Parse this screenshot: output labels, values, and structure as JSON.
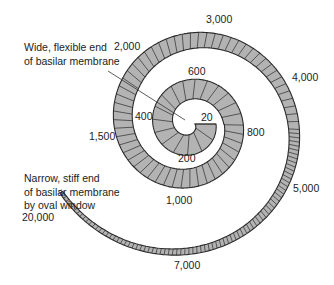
{
  "diagram": {
    "notes": {
      "apex": [
        "Wide, flexible end",
        "of basilar membrane"
      ],
      "base": [
        "Narrow, stiff end",
        "of basilar membrane",
        "by oval window"
      ]
    },
    "frequency_labels": [
      {
        "text": "20",
        "x": 201,
        "y": 111
      },
      {
        "text": "200",
        "x": 178,
        "y": 152
      },
      {
        "text": "400",
        "x": 135,
        "y": 110
      },
      {
        "text": "600",
        "x": 188,
        "y": 65
      },
      {
        "text": "800",
        "x": 247,
        "y": 126
      },
      {
        "text": "1,000",
        "x": 166,
        "y": 194
      },
      {
        "text": "1,500",
        "x": 89,
        "y": 130
      },
      {
        "text": "2,000",
        "x": 114,
        "y": 40
      },
      {
        "text": "3,000",
        "x": 206,
        "y": 13
      },
      {
        "text": "4,000",
        "x": 292,
        "y": 71
      },
      {
        "text": "5,000",
        "x": 293,
        "y": 182
      },
      {
        "text": "7,000",
        "x": 174,
        "y": 259
      },
      {
        "text": "20,000",
        "x": 22,
        "y": 211
      }
    ],
    "colors": {
      "fill": "#b3b3b3",
      "stroke": "#2b2b2b",
      "text": "#222222"
    }
  }
}
